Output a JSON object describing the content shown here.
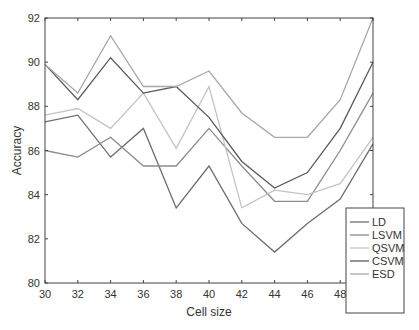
{
  "chart_data": {
    "type": "line",
    "title": "",
    "xlabel": "Cell size",
    "ylabel": "Accuracy",
    "x": [
      30,
      32,
      34,
      36,
      38,
      40,
      42,
      44,
      46,
      48,
      50
    ],
    "xlim": [
      30,
      50
    ],
    "ylim": [
      80,
      92
    ],
    "xticks": [
      30,
      32,
      34,
      36,
      38,
      40,
      42,
      44,
      46,
      48,
      50
    ],
    "yticks": [
      80,
      82,
      84,
      86,
      88,
      90,
      92
    ],
    "grid": false,
    "legend_position": "lower right",
    "series": [
      {
        "name": "LD",
        "color": "#6e6e6e",
        "values": [
          87.3,
          87.6,
          85.7,
          87.0,
          83.4,
          85.3,
          82.7,
          81.4,
          82.7,
          83.8,
          86.3
        ]
      },
      {
        "name": "LSVM",
        "color": "#8c8c8c",
        "values": [
          86.0,
          85.7,
          86.6,
          85.3,
          85.3,
          87.0,
          85.3,
          83.7,
          83.7,
          86.0,
          88.6
        ]
      },
      {
        "name": "QSVM",
        "color": "#c4c4c4",
        "values": [
          87.6,
          87.9,
          87.0,
          88.6,
          86.1,
          88.9,
          83.4,
          84.2,
          84.0,
          84.5,
          86.6
        ]
      },
      {
        "name": "CSVM",
        "color": "#5a5a5a",
        "values": [
          89.9,
          88.3,
          90.2,
          88.6,
          88.9,
          87.5,
          85.5,
          84.3,
          85.0,
          87.0,
          90.0
        ]
      },
      {
        "name": "ESD",
        "color": "#a8a8a8",
        "values": [
          89.9,
          88.6,
          91.2,
          88.9,
          88.9,
          89.6,
          87.7,
          86.6,
          86.6,
          88.3,
          92.0
        ]
      }
    ]
  }
}
